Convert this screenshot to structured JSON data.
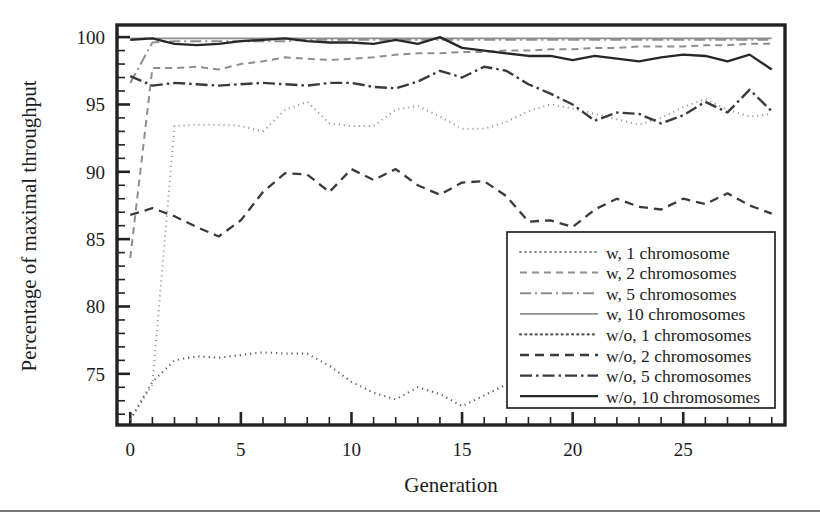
{
  "chart_data": {
    "type": "line",
    "title": "",
    "xlabel": "Generation",
    "ylabel": "Percentage of maximal throughput",
    "xlim": [
      -0.6,
      29.6
    ],
    "ylim": [
      71.2,
      100.9
    ],
    "xticks": [
      0,
      5,
      10,
      15,
      20,
      25
    ],
    "xtick_labels": [
      "0",
      "5",
      "10",
      "15",
      "20",
      "25"
    ],
    "yticks": [
      75,
      80,
      85,
      90,
      95,
      100
    ],
    "ytick_labels": [
      "75",
      "80",
      "85",
      "90",
      "95",
      "100"
    ],
    "x_minor_step": 1,
    "y_minor_step": 1,
    "grid": false,
    "legend_position": "lower right",
    "x": [
      0,
      1,
      2,
      3,
      4,
      5,
      6,
      7,
      8,
      9,
      10,
      11,
      12,
      13,
      14,
      15,
      16,
      17,
      18,
      19,
      20,
      21,
      22,
      23,
      24,
      25,
      26,
      27,
      28,
      29
    ],
    "series": [
      {
        "name": "w, 1 chromosome",
        "style": "dotted",
        "color": "#8e8e8e",
        "width": 2.0,
        "dash": "1,4",
        "values": [
          71.6,
          74.2,
          93.4,
          93.5,
          93.5,
          93.4,
          93.0,
          94.6,
          95.2,
          93.6,
          93.4,
          93.4,
          94.6,
          94.9,
          94.1,
          93.2,
          93.2,
          93.7,
          94.5,
          95.0,
          94.7,
          94.3,
          93.9,
          93.5,
          94.0,
          94.8,
          95.4,
          94.6,
          94.1,
          94.3
        ]
      },
      {
        "name": "w, 2 chromosomes",
        "style": "dashed",
        "color": "#8e8e8e",
        "width": 2.0,
        "dash": "7,5",
        "values": [
          83.6,
          97.7,
          97.7,
          97.8,
          97.6,
          98.0,
          98.2,
          98.5,
          98.4,
          98.3,
          98.4,
          98.5,
          98.7,
          98.8,
          98.8,
          98.9,
          98.9,
          99.0,
          99.0,
          99.1,
          99.1,
          99.2,
          99.2,
          99.3,
          99.3,
          99.3,
          99.4,
          99.4,
          99.5,
          99.5
        ]
      },
      {
        "name": "w, 5 chromosomes",
        "style": "dashdot",
        "color": "#8e8e8e",
        "width": 2.0,
        "dash": "11,4,2,4",
        "values": [
          96.6,
          99.6,
          99.7,
          99.7,
          99.7,
          99.7,
          99.7,
          99.7,
          99.8,
          99.8,
          99.8,
          99.8,
          99.8,
          99.8,
          99.8,
          99.8,
          99.8,
          99.8,
          99.8,
          99.8,
          99.8,
          99.8,
          99.8,
          99.8,
          99.8,
          99.8,
          99.8,
          99.8,
          99.8,
          99.8
        ]
      },
      {
        "name": "w, 10 chromosomes",
        "style": "solid",
        "color": "#8e8e8e",
        "width": 1.8,
        "dash": "none",
        "values": [
          99.9,
          99.9,
          99.9,
          99.9,
          99.9,
          99.9,
          99.9,
          99.9,
          99.9,
          99.9,
          99.9,
          99.9,
          99.9,
          99.9,
          99.9,
          99.9,
          99.9,
          99.9,
          99.9,
          99.9,
          99.9,
          99.9,
          99.9,
          99.9,
          99.9,
          99.9,
          99.9,
          99.9,
          99.9,
          99.9
        ]
      },
      {
        "name": "w/o, 1 chromosomes",
        "style": "dotted",
        "color": "#5a5a5a",
        "width": 2.1,
        "dash": "1.2,4",
        "values": [
          71.6,
          74.4,
          76.0,
          76.3,
          76.2,
          76.4,
          76.6,
          76.5,
          76.5,
          75.6,
          74.4,
          73.6,
          73.1,
          74.0,
          73.5,
          72.6,
          73.4,
          74.2,
          74.0,
          73.8,
          74.2,
          75.2,
          75.6,
          75.4,
          74.7,
          75.4,
          76.0,
          75.8,
          75.2,
          75.4
        ]
      },
      {
        "name": "w/o, 2 chromosomes",
        "style": "dashed",
        "color": "#3a3a3a",
        "width": 2.3,
        "dash": "9,6",
        "values": [
          86.8,
          87.3,
          86.7,
          85.9,
          85.2,
          86.4,
          88.5,
          89.9,
          89.8,
          88.5,
          90.2,
          89.4,
          90.2,
          89.0,
          88.3,
          89.2,
          89.3,
          88.2,
          86.3,
          86.4,
          85.9,
          87.2,
          88.0,
          87.4,
          87.2,
          88.0,
          87.6,
          88.4,
          87.5,
          86.9
        ]
      },
      {
        "name": "w/o, 5 chromosomes",
        "style": "dashdot",
        "color": "#3a3a3a",
        "width": 2.4,
        "dash": "12,4,2.5,4",
        "values": [
          97.1,
          96.4,
          96.6,
          96.5,
          96.4,
          96.5,
          96.6,
          96.5,
          96.4,
          96.6,
          96.6,
          96.3,
          96.2,
          96.7,
          97.5,
          97.0,
          97.8,
          97.5,
          96.5,
          95.8,
          95.0,
          93.8,
          94.4,
          94.3,
          93.6,
          94.2,
          95.2,
          94.4,
          96.1,
          94.5
        ]
      },
      {
        "name": "w/o, 10 chromosomes",
        "style": "solid",
        "color": "#272727",
        "width": 2.3,
        "dash": "none",
        "values": [
          99.8,
          99.9,
          99.5,
          99.4,
          99.5,
          99.7,
          99.8,
          99.9,
          99.7,
          99.6,
          99.6,
          99.5,
          99.8,
          99.5,
          100.0,
          99.2,
          99.0,
          98.8,
          98.6,
          98.6,
          98.3,
          98.6,
          98.4,
          98.2,
          98.5,
          98.7,
          98.6,
          98.2,
          98.7,
          97.6
        ]
      }
    ]
  },
  "legend": {
    "entries": [
      "w, 1 chromosome",
      "w, 2 chromosomes",
      "w, 5 chromosomes",
      "w, 10 chromosomes",
      "w/o, 1 chromosomes",
      "w/o, 2 chromosomes",
      "w/o, 5 chromosomes",
      "w/o, 10 chromosomes"
    ]
  },
  "colors": {
    "axis": "#222222",
    "text": "#1c1c1c",
    "background": "#ffffff",
    "light_series": "#8e8e8e",
    "dark_series": "#272727"
  }
}
